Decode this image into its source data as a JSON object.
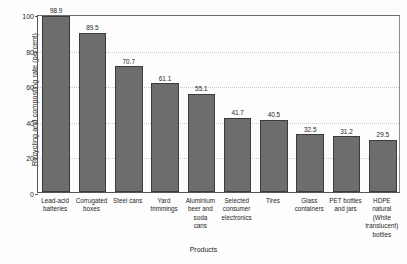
{
  "chart_data": {
    "type": "bar",
    "title": "",
    "xlabel": "Products",
    "ylabel": "Recycling and composting rate (percent)",
    "ylim": [
      0,
      100
    ],
    "yticks": [
      0,
      20,
      40,
      60,
      80,
      100
    ],
    "grid": true,
    "legend": "none",
    "bar_color": "#6d6d6d",
    "bar_edge_color": "#3b3b3b",
    "categories": [
      "Lead-acid batteries",
      "Corrugated boxes",
      "Steel cans",
      "Yard trimmings",
      "Aluminium beer and soda cans",
      "Selected consumer electronics",
      "Tires",
      "Glass containers",
      "PET bottles and jars",
      "HDPE natural (White translucent) bottles"
    ],
    "category_lines": [
      [
        "Lead-acid",
        "batteries"
      ],
      [
        "Corrugated",
        "boxes"
      ],
      [
        "Steel cans"
      ],
      [
        "Yard",
        "trimmings"
      ],
      [
        "Aluminium",
        "beer and soda",
        "cans"
      ],
      [
        "Selected",
        "consumer",
        "electronics"
      ],
      [
        "Tires"
      ],
      [
        "Glass",
        "containers"
      ],
      [
        "PET bottles",
        "and jars"
      ],
      [
        "HDPE natural",
        "(White",
        "translucent)",
        "bottles"
      ]
    ],
    "values": [
      98.9,
      89.5,
      70.7,
      61.1,
      55.1,
      41.7,
      40.5,
      32.5,
      31.2,
      29.5
    ],
    "value_labels": [
      "98.9",
      "89.5",
      "70.7",
      "61.1",
      "55.1",
      "41.7",
      "40.5",
      "32.5",
      "31.2",
      "29.5"
    ]
  }
}
